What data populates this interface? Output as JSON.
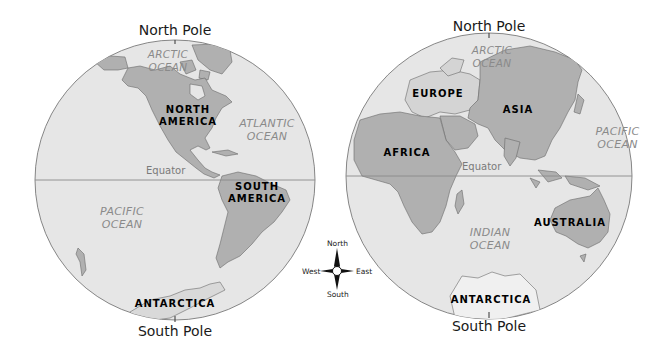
{
  "colors": {
    "ocean": "#e6e6e6",
    "land": "#b0b0b0",
    "land_light": "#d4d4d4",
    "outline": "#6a6a6a",
    "equator_line": "#8a8a8a",
    "background": "#ffffff"
  },
  "western_hemisphere": {
    "north_pole_label": "North Pole",
    "south_pole_label": "South Pole",
    "equator_label": "Equator",
    "oceans": {
      "arctic": [
        "ARCTIC",
        "OCEAN"
      ],
      "atlantic": [
        "ATLANTIC",
        "OCEAN"
      ],
      "pacific": [
        "PACIFIC",
        "OCEAN"
      ]
    },
    "continents": {
      "north_america": [
        "NORTH",
        "AMERICA"
      ],
      "south_america": [
        "SOUTH",
        "AMERICA"
      ],
      "antarctica": "ANTARCTICA"
    }
  },
  "eastern_hemisphere": {
    "north_pole_label": "North Pole",
    "south_pole_label": "South Pole",
    "equator_label": "Equator",
    "oceans": {
      "arctic": [
        "ARCTIC",
        "OCEAN"
      ],
      "pacific": [
        "PACIFIC",
        "OCEAN"
      ],
      "indian": [
        "INDIAN",
        "OCEAN"
      ]
    },
    "continents": {
      "europe": "EUROPE",
      "asia": "ASIA",
      "africa": "AFRICA",
      "australia": "AUSTRALIA",
      "antarctica": "ANTARCTICA"
    }
  },
  "compass_rose": {
    "north": "North",
    "south": "South",
    "east": "East",
    "west": "West"
  }
}
